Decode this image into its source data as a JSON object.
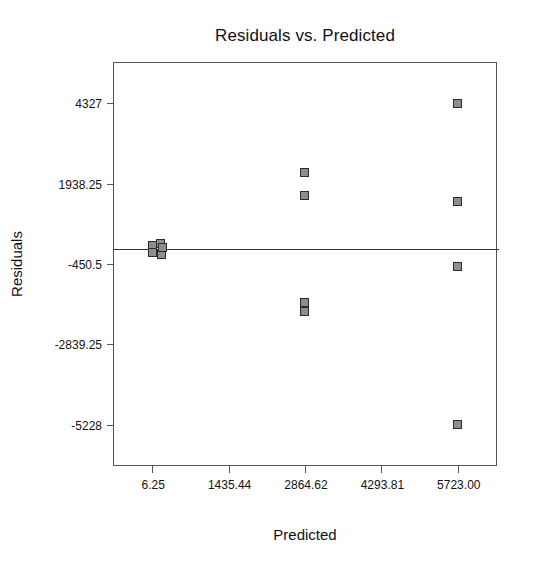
{
  "chart_data": {
    "type": "scatter",
    "title": "Residuals vs. Predicted",
    "xlabel": "Predicted",
    "ylabel": "Residuals",
    "grid": false,
    "legend": null,
    "xlim": [
      -708.3,
      6437.6
    ],
    "ylim": [
      -6422.4,
      5521.4
    ],
    "xticks": [
      6.25,
      1435.44,
      2864.62,
      4293.81,
      5723.0
    ],
    "xtick_labels": [
      "6.25",
      "1435.44",
      "2864.62",
      "4293.81",
      "5723.00"
    ],
    "yticks": [
      4327,
      1938.25,
      -450.5,
      -2839.25,
      -5228
    ],
    "ytick_labels": [
      "4327",
      "1938.25",
      "-450.5",
      "-2839.25",
      "-5228"
    ],
    "reference_line": {
      "orientation": "horizontal",
      "y": 0,
      "color": "#333333"
    },
    "marker_style": {
      "shape": "square",
      "fill": "#8e8e8e",
      "edge": "#2b2b2b",
      "size_px": 9
    },
    "series": [
      {
        "name": "Residuals",
        "points": [
          {
            "x": 6.25,
            "y": 100
          },
          {
            "x": 6.25,
            "y": -110
          },
          {
            "x": 170.0,
            "y": 150
          },
          {
            "x": 180.0,
            "y": -170
          },
          {
            "x": 190.0,
            "y": 30
          },
          {
            "x": 2864.62,
            "y": 2255
          },
          {
            "x": 2864.62,
            "y": 1580
          },
          {
            "x": 2864.62,
            "y": -1585
          },
          {
            "x": 2864.62,
            "y": -1860
          },
          {
            "x": 5723.0,
            "y": 4327
          },
          {
            "x": 5723.0,
            "y": 1400
          },
          {
            "x": 5723.0,
            "y": -530
          },
          {
            "x": 5723.0,
            "y": -5228
          }
        ]
      }
    ]
  }
}
